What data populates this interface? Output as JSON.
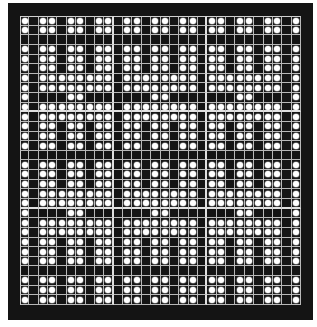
{
  "pattern": {
    "columns": 30,
    "rows": 30,
    "major_block_size": 10,
    "colors": {
      "background": "#ffffff",
      "frame": "#141414",
      "grid_line": "#b8b8b8",
      "major_line": "#e0e0e0",
      "dot": "#ffffff"
    },
    "row_types": [
      "P",
      "P",
      "X",
      "P",
      "P",
      "P",
      "B",
      "B",
      "S",
      "B",
      "B",
      "P",
      "P",
      "P",
      "X",
      "P",
      "P",
      "P",
      "B",
      "B",
      "S",
      "B",
      "B",
      "P",
      "P",
      "P",
      "X",
      "P",
      "P",
      "P"
    ],
    "row_type_legend": {
      "P": "pillar row: dots in all columns except every 3rd column starting at column 2",
      "B": "bridge row: dots in all columns except columns 2, 11, 20, 29",
      "S": "sparse row: dots only in columns 1, 6, 7, 15, 16, 24, 25, 30",
      "X": "blank row: no dots"
    },
    "empty_columns_pillar": [
      2,
      5,
      8,
      11,
      14,
      17,
      20,
      23,
      26,
      29
    ],
    "empty_columns_bridge": [
      2,
      11,
      20,
      29
    ],
    "filled_columns_sparse": [
      1,
      6,
      7,
      15,
      16,
      24,
      25,
      30
    ]
  }
}
